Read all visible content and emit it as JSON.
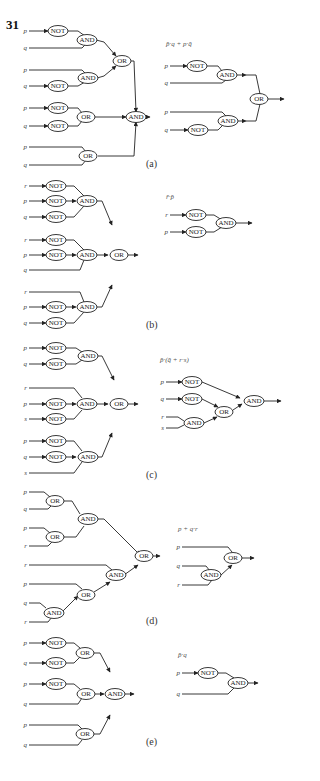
{
  "problem_number": "31",
  "gate_names": {
    "not": "NOT",
    "and": "AND",
    "or": "OR"
  },
  "parts": [
    {
      "label": "(a)",
      "simplified_expression": "p̄·q + p·q̄"
    },
    {
      "label": "(b)",
      "simplified_expression": "r̄·p̄"
    },
    {
      "label": "(c)",
      "simplified_expression": "p̄·(q̄ + r·s)"
    },
    {
      "label": "(d)",
      "simplified_expression": "p + q·r"
    },
    {
      "label": "(e)",
      "simplified_expression": "p̄·q"
    }
  ],
  "circuits": {
    "a_left": {
      "inputs": [
        "p",
        "q",
        "p",
        "q",
        "p",
        "q",
        "p",
        "q"
      ]
    },
    "a_right": {
      "inputs": [
        "p",
        "q",
        "p",
        "q"
      ]
    },
    "b_left": {
      "inputs": [
        "r",
        "p",
        "q",
        "r",
        "p",
        "q",
        "r",
        "p",
        "q"
      ]
    },
    "b_right": {
      "inputs": [
        "r",
        "p"
      ]
    },
    "c_left": {
      "inputs": [
        "p",
        "q",
        "r",
        "p",
        "s",
        "p",
        "q",
        "s"
      ]
    },
    "c_right": {
      "inputs": [
        "p",
        "q",
        "r",
        "s"
      ]
    },
    "d_left": {
      "inputs": [
        "p",
        "q",
        "p",
        "r",
        "r",
        "p",
        "q",
        "r"
      ]
    },
    "d_right": {
      "inputs": [
        "p",
        "q",
        "r"
      ]
    },
    "e_left": {
      "inputs": [
        "p",
        "q",
        "p",
        "q",
        "p",
        "q"
      ]
    },
    "e_right": {
      "inputs": [
        "p",
        "q"
      ]
    }
  }
}
